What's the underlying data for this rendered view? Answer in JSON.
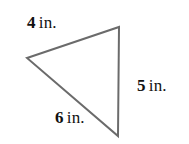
{
  "figure": {
    "type": "triangle",
    "background_color": "#ffffff",
    "stroke_color": "#6b6b6b",
    "stroke_width": 2,
    "fill": "none",
    "vertices": [
      {
        "name": "left-vertex",
        "x": 27,
        "y": 58
      },
      {
        "name": "top-right-vertex",
        "x": 119,
        "y": 27
      },
      {
        "name": "bottom-right-vertex",
        "x": 118,
        "y": 136
      }
    ],
    "path": "M 27 58 L 119 27 L 118 136 Z"
  },
  "labels": {
    "side_a": {
      "number": "4",
      "unit": "in.",
      "text": "4 in."
    },
    "side_b": {
      "number": "5",
      "unit": "in.",
      "text": "5 in."
    },
    "side_c": {
      "number": "6",
      "unit": "in.",
      "text": "6 in."
    }
  }
}
